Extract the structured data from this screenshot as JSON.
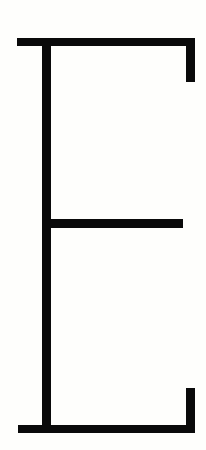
{
  "glyph": {
    "character": "E",
    "style": "bracketed serif capital letter, black strokes on white",
    "stroke_color": "#0a0a0a",
    "background_color": "#fefefc"
  }
}
